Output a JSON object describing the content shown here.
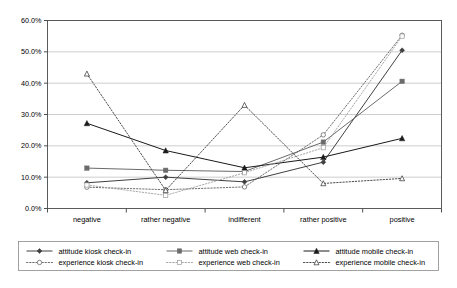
{
  "chart_data": {
    "type": "line",
    "title": "",
    "xlabel": "",
    "ylabel": "",
    "categories": [
      "negative",
      "rather negative",
      "indifferent",
      "rather positive",
      "positive"
    ],
    "ylim": [
      0,
      60
    ],
    "ytick_labels": [
      "0.0%",
      "10.0%",
      "20.0%",
      "30.0%",
      "40.0%",
      "50.0%",
      "60.0%"
    ],
    "ytick_values": [
      0,
      10,
      20,
      30,
      40,
      50,
      60
    ],
    "grid": "horizontal",
    "legend_position": "bottom",
    "series": [
      {
        "name": "attitude kiosk check-in",
        "line_style": "solid",
        "marker": "filled-diamond",
        "color": "#404040",
        "values": [
          8.2,
          10.0,
          8.5,
          14.8,
          50.5
        ]
      },
      {
        "name": "attitude web check-in",
        "line_style": "solid",
        "marker": "filled-square",
        "color": "#6b6b6b",
        "values": [
          12.9,
          12.2,
          11.8,
          21.2,
          40.6
        ]
      },
      {
        "name": "attitude mobile check-in",
        "line_style": "solid",
        "marker": "filled-triangle",
        "color": "#1a1a1a",
        "values": [
          27.2,
          18.5,
          13.0,
          16.4,
          22.4
        ]
      },
      {
        "name": "experience kiosk check-in",
        "line_style": "dotted",
        "marker": "hollow-circle",
        "color": "#555555",
        "values": [
          6.8,
          6.0,
          6.9,
          23.5,
          55.3
        ]
      },
      {
        "name": "experience web check-in",
        "line_style": "dotted",
        "marker": "hollow-square",
        "color": "#9a9a9a",
        "values": [
          7.5,
          4.2,
          11.4,
          19.4,
          55.0
        ]
      },
      {
        "name": "experience mobile check-in",
        "line_style": "dotted",
        "marker": "hollow-triangle",
        "color": "#2b2b2b",
        "values": [
          43.0,
          5.8,
          33.0,
          8.0,
          9.6
        ]
      }
    ]
  }
}
